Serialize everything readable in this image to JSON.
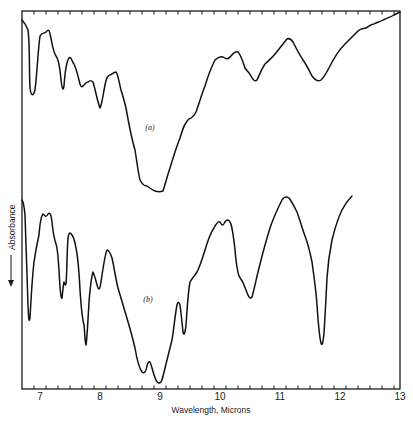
{
  "chart_data": {
    "type": "line",
    "title": "",
    "xlabel": "Wavelength, Microns",
    "ylabel": "Absorbance",
    "ylabel_arrow": "down",
    "xlim": [
      6.7,
      13
    ],
    "x_ticks": [
      7,
      8,
      9,
      10,
      11,
      12,
      13
    ],
    "x_tick_labels": [
      "7",
      "8",
      "9",
      "10",
      "11",
      "12",
      "13"
    ],
    "minor_ticks_per_major": 5,
    "y_ticks": [],
    "grid": false,
    "legend": "none (inline labels)",
    "series": [
      {
        "name": "(a)",
        "label_position": {
          "x": 8.85,
          "y_px": 127
        },
        "description": "Upper infrared absorption spectrum (absorbance increases downward); broad strong band near 8.8-9.1 microns",
        "points_wavelength_relative_depth": [
          [
            6.7,
            0.05
          ],
          [
            6.85,
            0.45
          ],
          [
            7.0,
            0.12
          ],
          [
            7.1,
            0.1
          ],
          [
            7.25,
            0.25
          ],
          [
            7.37,
            0.42
          ],
          [
            7.48,
            0.25
          ],
          [
            7.58,
            0.31
          ],
          [
            7.68,
            0.4
          ],
          [
            7.87,
            0.37
          ],
          [
            8.0,
            0.52
          ],
          [
            8.15,
            0.34
          ],
          [
            8.27,
            0.32
          ],
          [
            8.37,
            0.44
          ],
          [
            8.5,
            0.56
          ],
          [
            8.67,
            0.72
          ],
          [
            8.8,
            0.95
          ],
          [
            8.92,
            1.0
          ],
          [
            9.05,
            1.0
          ],
          [
            9.17,
            0.88
          ],
          [
            9.33,
            0.72
          ],
          [
            9.47,
            0.6
          ],
          [
            9.58,
            0.54
          ],
          [
            9.83,
            0.37
          ],
          [
            10.03,
            0.27
          ],
          [
            10.25,
            0.25
          ],
          [
            10.42,
            0.32
          ],
          [
            10.5,
            0.38
          ],
          [
            10.75,
            0.23
          ],
          [
            11.13,
            0.15
          ],
          [
            11.33,
            0.23
          ],
          [
            11.58,
            0.38
          ],
          [
            11.67,
            0.39
          ],
          [
            11.92,
            0.27
          ],
          [
            12.25,
            0.11
          ],
          [
            12.5,
            0.07
          ],
          [
            12.83,
            0.03
          ],
          [
            13.0,
            0.01
          ]
        ]
      },
      {
        "name": "(b)",
        "label_position": {
          "x": 8.78,
          "y_px": 299
        },
        "description": "Lower infrared absorption spectrum; sharp bands near 6.8, 7.8, 9.0, 9.4, 10.5 and 11.85 microns",
        "points_wavelength_relative_depth": [
          [
            6.7,
            0.02
          ],
          [
            6.82,
            0.8
          ],
          [
            6.95,
            0.38
          ],
          [
            7.13,
            0.1
          ],
          [
            7.3,
            0.31
          ],
          [
            7.35,
            0.65
          ],
          [
            7.43,
            0.55
          ],
          [
            7.48,
            0.22
          ],
          [
            7.63,
            0.44
          ],
          [
            7.8,
            0.95
          ],
          [
            7.92,
            0.48
          ],
          [
            8.05,
            0.62
          ],
          [
            8.2,
            0.35
          ],
          [
            8.42,
            0.6
          ],
          [
            8.72,
            0.92
          ],
          [
            8.8,
            0.85
          ],
          [
            8.98,
            1.0
          ],
          [
            9.27,
            0.62
          ],
          [
            9.33,
            0.56
          ],
          [
            9.42,
            0.73
          ],
          [
            9.48,
            0.43
          ],
          [
            9.8,
            0.32
          ],
          [
            10.05,
            0.17
          ],
          [
            10.15,
            0.2
          ],
          [
            10.23,
            0.15
          ],
          [
            10.42,
            0.43
          ],
          [
            10.52,
            0.6
          ],
          [
            10.87,
            0.24
          ],
          [
            11.13,
            0.0
          ],
          [
            11.45,
            0.25
          ],
          [
            11.75,
            0.52
          ],
          [
            11.83,
            0.83
          ],
          [
            12.03,
            0.18
          ],
          [
            12.23,
            0.02
          ]
        ]
      }
    ]
  }
}
